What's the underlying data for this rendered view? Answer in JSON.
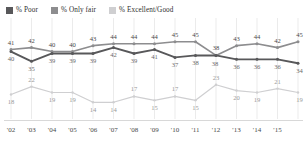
{
  "legend": {
    "items": [
      {
        "label": "% Poor",
        "color": "#58585a",
        "key": "poor"
      },
      {
        "label": "% Only fair",
        "color": "#8d8d8f",
        "key": "fair"
      },
      {
        "label": "% Excellent/Good",
        "color": "#cfcfd1",
        "key": "good"
      }
    ]
  },
  "chart_data": {
    "type": "line",
    "title": "",
    "xlabel": "",
    "ylabel": "",
    "grid": true,
    "legend_position": "top-left",
    "ylim": [
      0,
      60
    ],
    "categories": [
      "'02",
      "'03",
      "'04",
      "'05",
      "'06",
      "'07",
      "'08",
      "'09",
      "'10",
      "'11",
      "'12",
      "'13",
      "'14",
      "'15",
      ""
    ],
    "tick_labels": [
      "'02",
      "'03",
      "'04",
      "'05",
      "'06",
      "'07",
      "'08",
      "'09",
      "'10",
      "'11",
      "'12",
      "'13",
      "'14",
      "'15"
    ],
    "series": [
      {
        "name": "% Only fair",
        "key": "fair",
        "color": "#8d8d8f",
        "values": [
          41,
          42,
          40,
          40,
          43,
          44,
          44,
          44,
          45,
          45,
          38,
          43,
          44,
          42,
          45
        ]
      },
      {
        "name": "% Poor",
        "key": "poor",
        "color": "#58585a",
        "values": [
          40,
          35,
          39,
          39,
          39,
          42,
          39,
          41,
          37,
          38,
          38,
          36,
          36,
          36,
          34
        ]
      },
      {
        "name": "% Excellent/Good",
        "key": "good",
        "color": "#cfcfd1",
        "values": [
          18,
          22,
          19,
          19,
          14,
          14,
          17,
          15,
          17,
          15,
          23,
          20,
          19,
          21,
          19
        ]
      }
    ]
  }
}
